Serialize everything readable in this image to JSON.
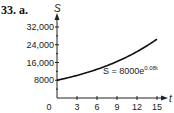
{
  "problem_label": "33. a.",
  "chart_data": {
    "type": "line",
    "title": "",
    "xlabel": "t",
    "ylabel": "S",
    "x_ticks": [
      0,
      3,
      6,
      9,
      12,
      15
    ],
    "y_ticks": [
      8000,
      16000,
      24000,
      32000
    ],
    "y_tick_labels": [
      "8000",
      "16,000",
      "24,000",
      "32,000"
    ],
    "xlim": [
      0,
      15
    ],
    "ylim": [
      0,
      32000
    ],
    "grid": false,
    "annotation": "S = 8000e^(0.08t)",
    "series": [
      {
        "name": "S = 8000e^(0.08t)",
        "x": [
          0,
          3,
          6,
          9,
          12,
          15
        ],
        "values": [
          8000,
          10170,
          12929,
          16437,
          20896,
          26561
        ]
      }
    ]
  },
  "annotation": {
    "base": "S = 8000e",
    "exp": "0.08t"
  }
}
